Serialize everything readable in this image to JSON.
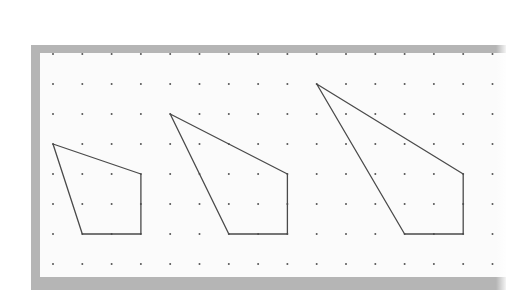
{
  "figure": {
    "colors": {
      "frame": "#b5b5b5",
      "paper": "#fbfbfb",
      "dot": "#555555",
      "line": "#4a4a4a"
    },
    "grid": {
      "origin_x": 53,
      "origin_y": 54,
      "step_x": 29.3,
      "step_y": 30,
      "columns": 16,
      "rows": 8
    },
    "shapes": [
      {
        "name": "quadrilateral-small",
        "vertices_grid": [
          [
            0,
            3
          ],
          [
            3,
            4
          ],
          [
            3,
            6
          ],
          [
            1,
            6
          ]
        ]
      },
      {
        "name": "quadrilateral-medium",
        "vertices_grid": [
          [
            4,
            2
          ],
          [
            8,
            4
          ],
          [
            8,
            6
          ],
          [
            6,
            6
          ]
        ]
      },
      {
        "name": "quadrilateral-large",
        "vertices_grid": [
          [
            9,
            1
          ],
          [
            14,
            4
          ],
          [
            14,
            6
          ],
          [
            12,
            6
          ]
        ]
      }
    ]
  }
}
